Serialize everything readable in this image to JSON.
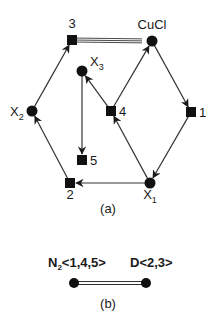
{
  "diagram_a": {
    "caption": "(a)",
    "nodes": [
      {
        "id": "3",
        "label": "3",
        "shape": "square",
        "x": 72,
        "y": 40
      },
      {
        "id": "CuCl",
        "label": "CuCl",
        "shape": "circle",
        "x": 152,
        "y": 41
      },
      {
        "id": "X3",
        "label": "X",
        "sub": "3",
        "shape": "circle",
        "x": 82,
        "y": 71
      },
      {
        "id": "X2",
        "label": "X",
        "sub": "2",
        "shape": "circle",
        "x": 32,
        "y": 111
      },
      {
        "id": "4",
        "label": "4",
        "shape": "square",
        "x": 111,
        "y": 111
      },
      {
        "id": "1",
        "label": "1",
        "shape": "square",
        "x": 191,
        "y": 112
      },
      {
        "id": "5",
        "label": "5",
        "shape": "square",
        "x": 82,
        "y": 160
      },
      {
        "id": "2",
        "label": "2",
        "shape": "square",
        "x": 70,
        "y": 183
      },
      {
        "id": "X1",
        "label": "X",
        "sub": "1",
        "shape": "circle",
        "x": 150,
        "y": 183
      }
    ],
    "edges": [
      {
        "from": "3",
        "to": "CuCl",
        "style": "triple"
      },
      {
        "from": "CuCl",
        "to": "1",
        "style": "single"
      },
      {
        "from": "1",
        "to": "X1",
        "style": "single"
      },
      {
        "from": "X1",
        "to": "2",
        "style": "single"
      },
      {
        "from": "2",
        "to": "X2",
        "style": "single"
      },
      {
        "from": "X2",
        "to": "3",
        "style": "single"
      },
      {
        "from": "4",
        "to": "CuCl",
        "style": "single"
      },
      {
        "from": "4",
        "to": "X3",
        "style": "single"
      },
      {
        "from": "X1",
        "to": "4",
        "style": "single"
      },
      {
        "from": "X3",
        "to": "5",
        "style": "single"
      }
    ]
  },
  "diagram_b": {
    "caption": "(b)",
    "left": {
      "label": "N",
      "sub": "2",
      "rest": "<1,4,5>"
    },
    "right": {
      "label": "D<2,3>"
    },
    "edge": "double"
  }
}
